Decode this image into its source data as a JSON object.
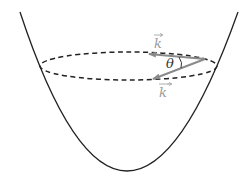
{
  "diagram": {
    "labels": {
      "k": "k",
      "k_prime": "k",
      "k_prime_mark": "′",
      "theta": "θ"
    },
    "colors": {
      "curve": "#222222",
      "dashed": "#222222",
      "arrow": "#8a8a8a",
      "label_gray": "#9a9a9a",
      "theta": "#333333"
    }
  }
}
